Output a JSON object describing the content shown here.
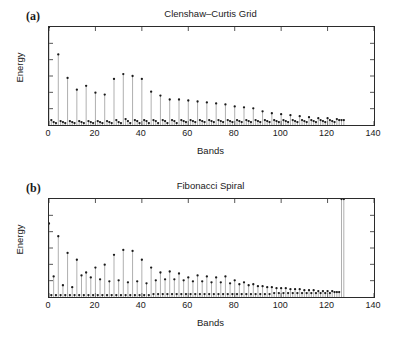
{
  "figure": {
    "background": "#ffffff",
    "axis_color": "#2b2b2b",
    "stem_color": "#8c8c8c",
    "marker_color": "#1a1a1a"
  },
  "panels": [
    {
      "letter": "(a)",
      "title": "Clenshaw–Curtis Grid",
      "xlabel": "Bands",
      "ylabel": "Energy"
    },
    {
      "letter": "(b)",
      "title": "Fibonacci Spiral",
      "xlabel": "Bands",
      "ylabel": "Energy"
    }
  ],
  "xticks": [
    "0",
    "20",
    "40",
    "60",
    "80",
    "100",
    "120",
    "140"
  ],
  "chart_data": [
    {
      "type": "line",
      "subtype": "stem",
      "panel": "(a)",
      "title": "Clenshaw–Curtis Grid",
      "xlabel": "Bands",
      "ylabel": "Energy",
      "xlim": [
        0,
        140
      ],
      "ylim": [
        0,
        1.0
      ],
      "xticks": [
        0,
        20,
        40,
        60,
        80,
        100,
        120,
        140
      ],
      "yticks": [],
      "grid": false,
      "legend": null,
      "marker": "filled-circle",
      "x": [
        0,
        1,
        2,
        3,
        4,
        5,
        6,
        7,
        8,
        9,
        10,
        11,
        12,
        13,
        14,
        15,
        16,
        17,
        18,
        19,
        20,
        21,
        22,
        23,
        24,
        25,
        26,
        27,
        28,
        29,
        30,
        31,
        32,
        33,
        34,
        35,
        36,
        37,
        38,
        39,
        40,
        41,
        42,
        43,
        44,
        45,
        46,
        47,
        48,
        49,
        50,
        51,
        52,
        53,
        54,
        55,
        56,
        57,
        58,
        59,
        60,
        61,
        62,
        63,
        64,
        65,
        66,
        67,
        68,
        69,
        70,
        71,
        72,
        73,
        74,
        75,
        76,
        77,
        78,
        79,
        80,
        81,
        82,
        83,
        84,
        85,
        86,
        87,
        88,
        89,
        90,
        91,
        92,
        93,
        94,
        95,
        96,
        97,
        98,
        99,
        100,
        101,
        102,
        103,
        104,
        105,
        106,
        107,
        108,
        109,
        110,
        111,
        112,
        113,
        114,
        115,
        116,
        117,
        118,
        119,
        120,
        121,
        122,
        123,
        124,
        125,
        126,
        127
      ],
      "y": [
        1.0,
        0.05,
        0.03,
        0.02,
        0.72,
        0.04,
        0.03,
        0.02,
        0.48,
        0.04,
        0.03,
        0.02,
        0.36,
        0.04,
        0.03,
        0.02,
        0.4,
        0.04,
        0.03,
        0.02,
        0.33,
        0.04,
        0.03,
        0.02,
        0.31,
        0.04,
        0.03,
        0.02,
        0.47,
        0.05,
        0.03,
        0.02,
        0.52,
        0.06,
        0.04,
        0.02,
        0.5,
        0.05,
        0.04,
        0.02,
        0.47,
        0.05,
        0.04,
        0.02,
        0.34,
        0.05,
        0.04,
        0.02,
        0.3,
        0.05,
        0.04,
        0.02,
        0.26,
        0.05,
        0.04,
        0.02,
        0.26,
        0.05,
        0.04,
        0.03,
        0.25,
        0.05,
        0.04,
        0.03,
        0.24,
        0.05,
        0.04,
        0.03,
        0.23,
        0.05,
        0.04,
        0.03,
        0.22,
        0.05,
        0.04,
        0.03,
        0.21,
        0.05,
        0.04,
        0.03,
        0.19,
        0.05,
        0.04,
        0.03,
        0.18,
        0.05,
        0.04,
        0.03,
        0.17,
        0.05,
        0.04,
        0.03,
        0.14,
        0.05,
        0.04,
        0.03,
        0.12,
        0.05,
        0.04,
        0.03,
        0.11,
        0.05,
        0.04,
        0.03,
        0.1,
        0.05,
        0.04,
        0.03,
        0.09,
        0.05,
        0.04,
        0.03,
        0.08,
        0.05,
        0.04,
        0.03,
        0.07,
        0.05,
        0.04,
        0.03,
        0.07,
        0.05,
        0.04,
        0.03,
        0.06,
        0.05,
        0.05,
        0.05
      ]
    },
    {
      "type": "line",
      "subtype": "stem",
      "panel": "(b)",
      "title": "Fibonacci Spiral",
      "xlabel": "Bands",
      "ylabel": "Energy",
      "xlim": [
        0,
        140
      ],
      "ylim": [
        0,
        1.0
      ],
      "xticks": [
        0,
        20,
        40,
        60,
        80,
        100,
        120,
        140
      ],
      "yticks": [],
      "grid": false,
      "legend": null,
      "marker": "filled-circle",
      "x": [
        0,
        1,
        2,
        3,
        4,
        5,
        6,
        7,
        8,
        9,
        10,
        11,
        12,
        13,
        14,
        15,
        16,
        17,
        18,
        19,
        20,
        21,
        22,
        23,
        24,
        25,
        26,
        27,
        28,
        29,
        30,
        31,
        32,
        33,
        34,
        35,
        36,
        37,
        38,
        39,
        40,
        41,
        42,
        43,
        44,
        45,
        46,
        47,
        48,
        49,
        50,
        51,
        52,
        53,
        54,
        55,
        56,
        57,
        58,
        59,
        60,
        61,
        62,
        63,
        64,
        65,
        66,
        67,
        68,
        69,
        70,
        71,
        72,
        73,
        74,
        75,
        76,
        77,
        78,
        79,
        80,
        81,
        82,
        83,
        84,
        85,
        86,
        87,
        88,
        89,
        90,
        91,
        92,
        93,
        94,
        95,
        96,
        97,
        98,
        99,
        100,
        101,
        102,
        103,
        104,
        105,
        106,
        107,
        108,
        109,
        110,
        111,
        112,
        113,
        114,
        115,
        116,
        117,
        118,
        119,
        120,
        121,
        122,
        123,
        124,
        125,
        126,
        127
      ],
      "y": [
        0.75,
        0.02,
        0.21,
        0.02,
        0.62,
        0.02,
        0.12,
        0.02,
        0.45,
        0.02,
        0.1,
        0.02,
        0.38,
        0.02,
        0.22,
        0.02,
        0.25,
        0.02,
        0.2,
        0.02,
        0.3,
        0.02,
        0.18,
        0.02,
        0.33,
        0.02,
        0.16,
        0.02,
        0.43,
        0.02,
        0.17,
        0.02,
        0.48,
        0.02,
        0.15,
        0.02,
        0.47,
        0.02,
        0.16,
        0.02,
        0.38,
        0.02,
        0.14,
        0.02,
        0.3,
        0.03,
        0.17,
        0.03,
        0.25,
        0.03,
        0.18,
        0.03,
        0.26,
        0.03,
        0.18,
        0.03,
        0.24,
        0.03,
        0.17,
        0.03,
        0.2,
        0.03,
        0.16,
        0.03,
        0.22,
        0.03,
        0.16,
        0.03,
        0.21,
        0.03,
        0.15,
        0.03,
        0.2,
        0.03,
        0.15,
        0.03,
        0.21,
        0.03,
        0.14,
        0.03,
        0.17,
        0.03,
        0.13,
        0.03,
        0.15,
        0.03,
        0.12,
        0.03,
        0.13,
        0.03,
        0.11,
        0.03,
        0.11,
        0.03,
        0.1,
        0.03,
        0.1,
        0.04,
        0.09,
        0.04,
        0.09,
        0.04,
        0.09,
        0.04,
        0.08,
        0.04,
        0.08,
        0.04,
        0.08,
        0.04,
        0.07,
        0.04,
        0.07,
        0.04,
        0.07,
        0.04,
        0.06,
        0.04,
        0.06,
        0.04,
        0.06,
        0.04,
        0.06,
        0.05,
        0.05,
        0.05
      ]
    }
  ]
}
